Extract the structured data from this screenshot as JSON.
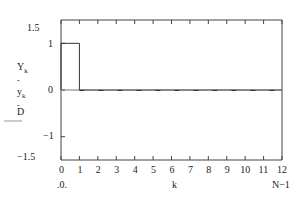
{
  "chart_data": {
    "type": "line",
    "title": "",
    "xlabel": "k",
    "ylabel": "Y_k, y_k, D",
    "xlim": [
      0,
      12
    ],
    "ylim": [
      -1.5,
      1.5
    ],
    "x_ticks": [
      "0",
      "1",
      "2",
      "3",
      "4",
      "5",
      "6",
      "7",
      "8",
      "9",
      "10",
      "11",
      "12"
    ],
    "y_ticks": [
      "1.5",
      "1",
      "0",
      "-1",
      "-1.5"
    ],
    "x_range_labels": {
      "start": ".0.",
      "end": "N-1"
    },
    "series": [
      {
        "name": "Y_k",
        "style": "step",
        "x": [
          0,
          1,
          2,
          3,
          4,
          5,
          6,
          7,
          8,
          9,
          10,
          11,
          12
        ],
        "values": [
          1,
          0,
          0,
          0,
          0,
          0,
          0,
          0,
          0,
          0,
          0,
          0,
          0
        ]
      },
      {
        "name": "y_k",
        "style": "dashed",
        "x": [
          0,
          1,
          2,
          3,
          4,
          5,
          6,
          7,
          8,
          9,
          10,
          11,
          12
        ],
        "values": [
          0,
          0,
          0,
          0,
          0,
          0,
          0,
          0,
          0,
          0,
          0,
          0,
          0
        ]
      },
      {
        "name": "D",
        "style": "solid",
        "x": [
          0,
          12
        ],
        "values": [
          0,
          0
        ]
      }
    ],
    "grid": false
  },
  "labels": {
    "y15": "1.5",
    "y1": "1",
    "y0": "0",
    "ym1": "−1",
    "ym15": "−1.5",
    "leg1": "Y",
    "leg1sub": "k",
    "leg2": "y",
    "leg2sub": "k",
    "leg3": "D",
    "xlabel": "k",
    "xstart": ".0.",
    "xend": "N−1"
  }
}
